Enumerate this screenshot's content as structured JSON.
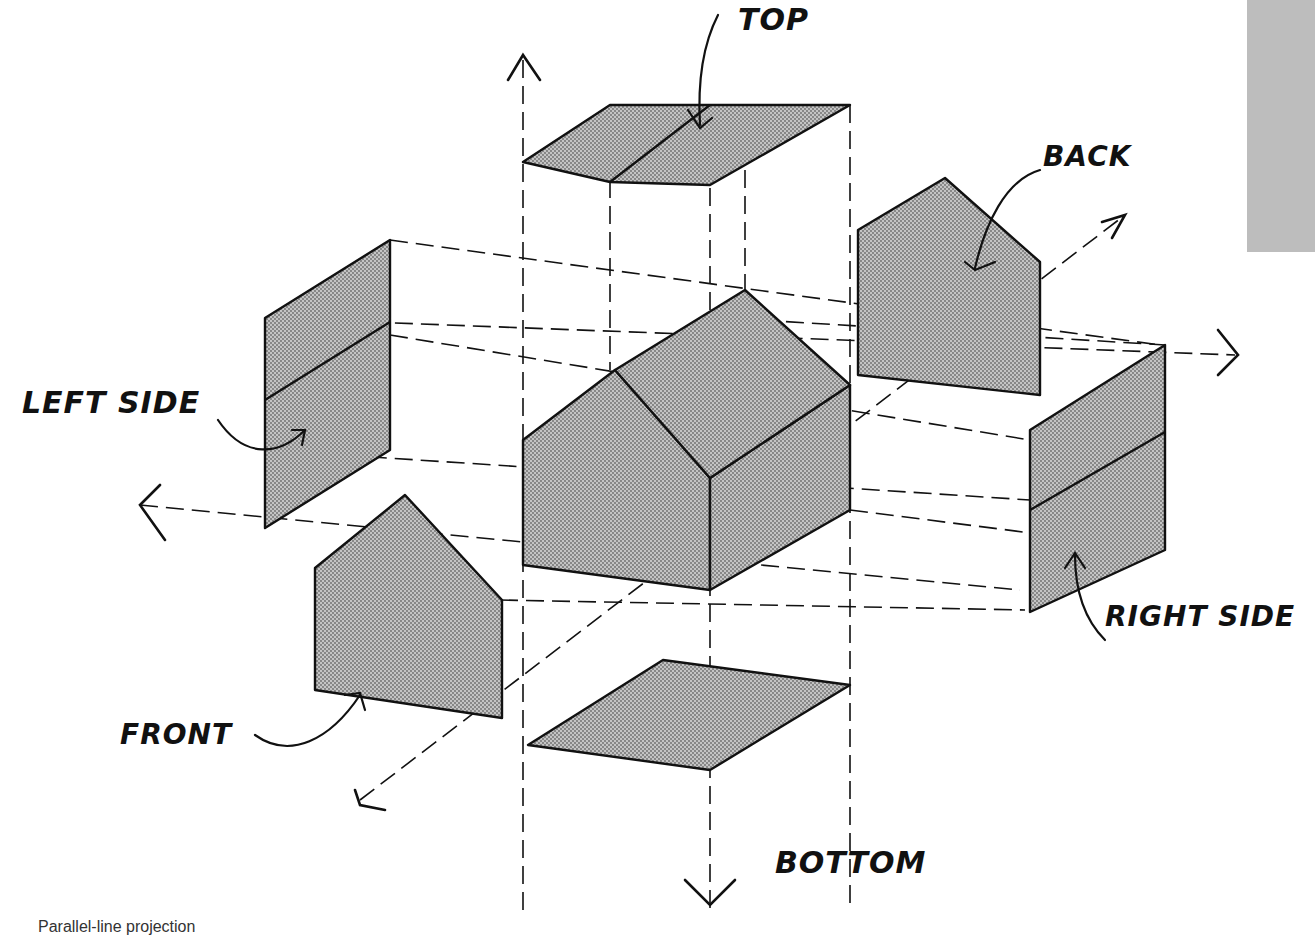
{
  "figure": {
    "caption": "Parallel-line projection",
    "labels": {
      "top": "TOP",
      "back": "BACK",
      "left_side": "LEFT SIDE",
      "right_side": "RIGHT SIDE",
      "front": "FRONT",
      "bottom": "BOTTOM"
    },
    "colors": {
      "face_fill": "#b8b8b8",
      "line": "#111111",
      "side_tab": "#bdbdbd"
    }
  }
}
